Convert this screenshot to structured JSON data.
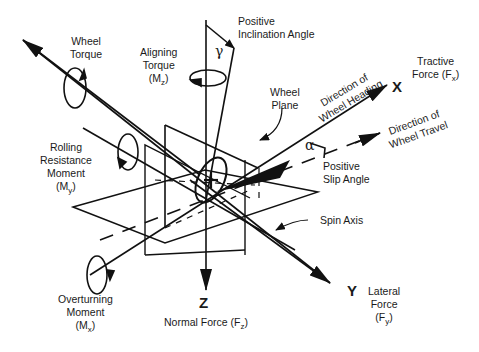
{
  "diagram": {
    "axes": {
      "x": {
        "letter": "X",
        "name": "Tractive",
        "force": "Force (F",
        "sub": "x",
        "close": ")"
      },
      "y": {
        "letter": "Y",
        "line1": "Lateral",
        "line2": "Force",
        "force": "(F",
        "sub": "y",
        "close": ")"
      },
      "z": {
        "letter": "Z",
        "force": "Normal Force (F",
        "sub": "z",
        "close": ")"
      }
    },
    "moments": {
      "wheel_torque": {
        "line1": "Wheel",
        "line2": "Torque"
      },
      "aligning_torque": {
        "line1": "Aligning",
        "line2": "Torque",
        "sym": "(M",
        "sub": "z",
        "close": ")"
      },
      "rolling_resistance": {
        "line1": "Rolling",
        "line2": "Resistance",
        "line3": "Moment",
        "sym": "(M",
        "sub": "y",
        "close": ")"
      },
      "overturning": {
        "line1": "Overturning",
        "line2": "Moment",
        "sym": "(M",
        "sub": "x",
        "close": ")"
      }
    },
    "angles": {
      "inclination": {
        "symbol": "γ",
        "line1": "Positive",
        "line2": "Inclination Angle"
      },
      "slip": {
        "symbol": "α",
        "line1": "Positive",
        "line2": "Slip Angle"
      }
    },
    "directions": {
      "heading": {
        "line1": "Direction of",
        "line2": "Wheel Heading"
      },
      "travel": {
        "line1": "Direction of",
        "line2": "Wheel Travel"
      }
    },
    "parts": {
      "wheel_plane": {
        "line1": "Wheel",
        "line2": "Plane"
      },
      "spin_axis": "Spin Axis"
    }
  }
}
